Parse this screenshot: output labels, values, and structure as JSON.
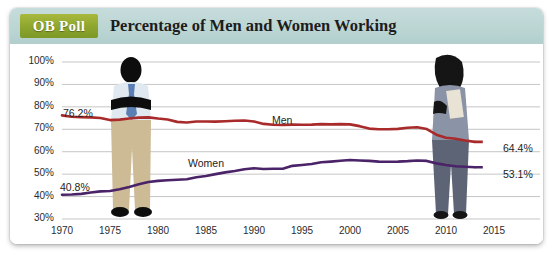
{
  "header": {
    "badge": "OB Poll",
    "title": "Percentage of Men and Women Working"
  },
  "chart_data": {
    "type": "line",
    "title": "Percentage of Men and Women Working",
    "xlabel": "",
    "ylabel": "",
    "xlim": [
      1970,
      2015
    ],
    "ylim": [
      30,
      100
    ],
    "yticks": [
      "30%",
      "40%",
      "50%",
      "60%",
      "70%",
      "80%",
      "90%",
      "100%"
    ],
    "ytick_values": [
      30,
      40,
      50,
      60,
      70,
      80,
      90,
      100
    ],
    "xticks": [
      "1970",
      "1975",
      "1980",
      "1985",
      "1990",
      "1995",
      "2000",
      "2005",
      "2010",
      "2015"
    ],
    "xtick_values": [
      1970,
      1975,
      1980,
      1985,
      1990,
      1995,
      2000,
      2005,
      2010,
      2015
    ],
    "grid": true,
    "legend_position": "inline",
    "series": [
      {
        "name": "Men",
        "color": "#a82a2a",
        "start_label": "76.2%",
        "end_label": "64.4%",
        "x": [
          1970,
          1971,
          1972,
          1973,
          1974,
          1975,
          1976,
          1977,
          1978,
          1979,
          1980,
          1981,
          1982,
          1983,
          1984,
          1985,
          1986,
          1987,
          1988,
          1989,
          1990,
          1991,
          1992,
          1993,
          1994,
          1995,
          1996,
          1997,
          1998,
          1999,
          2000,
          2001,
          2002,
          2003,
          2004,
          2005,
          2006,
          2007,
          2008,
          2009,
          2010,
          2011,
          2012,
          2013
        ],
        "values": [
          76.2,
          75.6,
          75.4,
          75.3,
          75.0,
          74.1,
          74.3,
          74.8,
          75.2,
          75.3,
          74.8,
          74.4,
          73.3,
          73.0,
          73.5,
          73.5,
          73.4,
          73.6,
          73.8,
          73.9,
          73.5,
          72.4,
          72.0,
          71.9,
          72.1,
          72.0,
          72.1,
          72.3,
          72.2,
          72.3,
          72.2,
          71.4,
          70.3,
          70.0,
          70.0,
          70.2,
          70.7,
          70.9,
          70.1,
          67.6,
          66.2,
          65.8,
          65.0,
          64.4
        ]
      },
      {
        "name": "Women",
        "color": "#4b2368",
        "start_label": "40.8%",
        "end_label": "53.1%",
        "x": [
          1970,
          1971,
          1972,
          1973,
          1974,
          1975,
          1976,
          1977,
          1978,
          1979,
          1980,
          1981,
          1982,
          1983,
          1984,
          1985,
          1986,
          1987,
          1988,
          1989,
          1990,
          1991,
          1992,
          1993,
          1994,
          1995,
          1996,
          1997,
          1998,
          1999,
          2000,
          2001,
          2002,
          2003,
          2004,
          2005,
          2006,
          2007,
          2008,
          2009,
          2010,
          2011,
          2012,
          2013
        ],
        "values": [
          40.8,
          40.9,
          41.2,
          41.8,
          42.3,
          42.5,
          43.3,
          44.3,
          45.5,
          46.5,
          47.0,
          47.3,
          47.5,
          47.7,
          48.6,
          49.2,
          50.0,
          50.8,
          51.4,
          52.2,
          52.6,
          52.3,
          52.4,
          52.4,
          53.7,
          54.1,
          54.5,
          55.3,
          55.6,
          56.0,
          56.3,
          56.1,
          55.9,
          55.6,
          55.5,
          55.6,
          55.8,
          56.1,
          55.9,
          54.8,
          54.1,
          53.5,
          53.3,
          53.1
        ]
      }
    ]
  },
  "figures": [
    {
      "name": "man-illustration",
      "label": "man"
    },
    {
      "name": "woman-illustration",
      "label": "woman"
    }
  ]
}
